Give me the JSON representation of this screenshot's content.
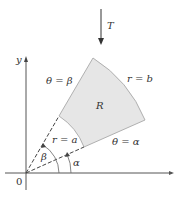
{
  "diagram": {
    "arrow_label": "T",
    "axes": {
      "y_label": "y",
      "x_label": "x",
      "origin_label": "0"
    },
    "region_label": "R",
    "curves": {
      "outer_arc": "r = b",
      "inner_arc": "r = a",
      "upper_ray": "θ = β",
      "lower_ray": "θ = α"
    },
    "angles": {
      "beta": "β",
      "alpha": "α"
    },
    "colors": {
      "region_fill": "#e6e6e6",
      "region_stroke": "#b0b0b0",
      "lines": "#444444"
    }
  }
}
